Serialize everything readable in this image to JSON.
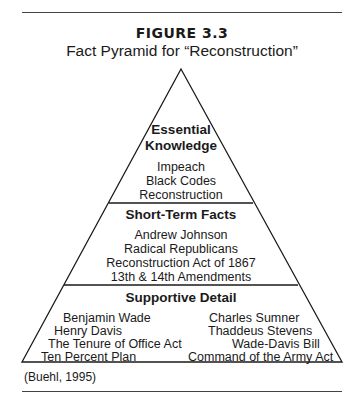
{
  "figure": {
    "label": "FIGURE 3.3",
    "title": "Fact Pyramid for “Reconstruction”",
    "credit": "(Buehl, 1995)"
  },
  "pyramid": {
    "levels": [
      {
        "heading_line1": "Essential",
        "heading_line2": "Knowledge",
        "items": [
          "Impeach",
          "Black Codes",
          "Reconstruction"
        ]
      },
      {
        "heading": "Short-Term Facts",
        "items": [
          "Andrew Johnson",
          "Radical Republicans",
          "Reconstruction Act of 1867",
          "13th & 14th Amendments"
        ]
      },
      {
        "heading": "Supportive Detail",
        "left_items": [
          "Benjamin Wade",
          "Henry Davis",
          "The Tenure of Office Act",
          "Ten Percent Plan"
        ],
        "right_items": [
          "Charles Sumner",
          "Thaddeus Stevens",
          "Wade-Davis Bill",
          "Command of the Army Act"
        ]
      }
    ]
  }
}
